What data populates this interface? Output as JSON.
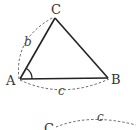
{
  "diagram": {
    "colors": {
      "line": "#222222",
      "dash": "#555555",
      "text": "#333333"
    },
    "vertices": [
      {
        "name": "A",
        "label": "A"
      },
      {
        "name": "B",
        "label": "B"
      },
      {
        "name": "C",
        "label": "C"
      }
    ],
    "side_labels": {
      "b": "b",
      "c": "c"
    },
    "angle_marker": "angle-A",
    "lower_figure": {
      "vertex_label": "C",
      "side_label": "c"
    }
  }
}
